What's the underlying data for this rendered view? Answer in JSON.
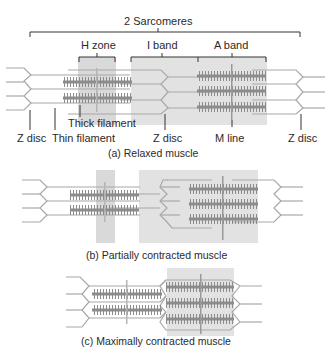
{
  "panels": {
    "relaxed": {
      "caption": "(a) Relaxed muscle",
      "labels": {
        "sarcomeres": "2 Sarcomeres",
        "h_zone": "H zone",
        "i_band": "I band",
        "a_band": "A band",
        "thick_filament": "Thick filament",
        "thin_filament": "Thin filament",
        "z_disc_left": "Z disc",
        "z_disc_middle": "Z disc",
        "z_disc_right": "Z disc",
        "m_line": "M line"
      }
    },
    "partial": {
      "caption": "(b) Partially contracted muscle"
    },
    "maximal": {
      "caption": "(c) Maximally contracted muscle"
    }
  },
  "colors": {
    "shade": "#d9d9d9",
    "thick": "#8c8c8c",
    "thin": "#a8a8a8",
    "line": "#333333"
  }
}
